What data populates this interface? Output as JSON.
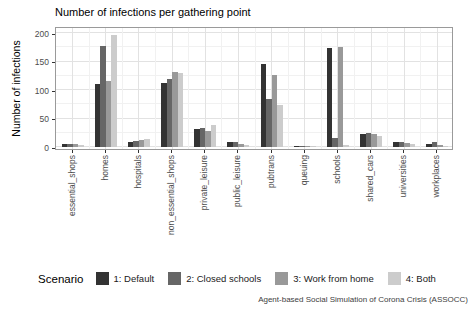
{
  "title": "Number of infections per gathering point",
  "y_axis": {
    "label": "Number of infections",
    "ticks": [
      0,
      50,
      100,
      150,
      200
    ]
  },
  "legend": {
    "title": "Scenario",
    "entries": [
      {
        "label": "1: Default",
        "color": "#333333"
      },
      {
        "label": "2: Closed schools",
        "color": "#666666"
      },
      {
        "label": "3: Work from home",
        "color": "#999999"
      },
      {
        "label": "4: Both",
        "color": "#CCCCCC"
      }
    ]
  },
  "caption": "Agent-based Social Simulation of Corona Crisis (ASSOCC)",
  "chart_data": {
    "type": "bar",
    "title": "Number of infections per gathering point",
    "xlabel": "",
    "ylabel": "Number of infections",
    "ylim": [
      0,
      200
    ],
    "grid": true,
    "legend_position": "bottom",
    "categories": [
      "essential_shops",
      "homes",
      "hospitals",
      "non_essential_shops",
      "private_leisure",
      "public_leisure",
      "pubtrans",
      "queuing",
      "schools",
      "shared_cars",
      "universities",
      "workplaces"
    ],
    "series": [
      {
        "name": "1: Default",
        "color": "#333333",
        "values": [
          6,
          110,
          9,
          113,
          31,
          8,
          145,
          2,
          174,
          23,
          9,
          5
        ]
      },
      {
        "name": "2: Closed schools",
        "color": "#666666",
        "values": [
          6,
          178,
          10,
          120,
          34,
          9,
          84,
          2,
          16,
          25,
          8,
          8
        ]
      },
      {
        "name": "3: Work from home",
        "color": "#999999",
        "values": [
          5,
          116,
          12,
          132,
          28,
          5,
          127,
          1,
          176,
          22,
          7,
          4
        ]
      },
      {
        "name": "4: Both",
        "color": "#CCCCCC",
        "values": [
          4,
          197,
          14,
          130,
          38,
          3,
          73,
          1,
          4,
          19,
          6,
          1
        ]
      }
    ],
    "y_major_gridlines": [
      0,
      50,
      100,
      150,
      200
    ],
    "y_minor_gridlines": [
      25,
      75,
      125,
      175
    ]
  }
}
